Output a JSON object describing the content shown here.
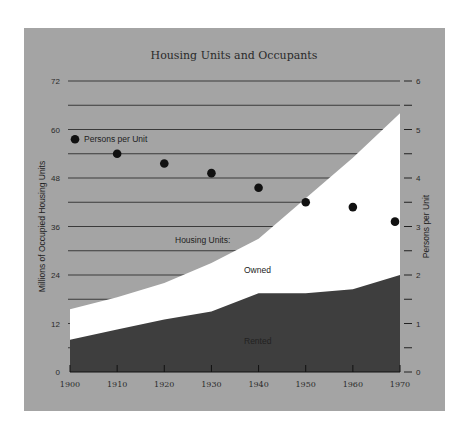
{
  "chart_data": {
    "type": "area",
    "title": "Housing Units and Occupants",
    "xlabel": "",
    "ylabel": "Millions of Occupied Housing Units",
    "ylabel_right": "Persons per Unit",
    "categories": [
      1900,
      1910,
      1920,
      1930,
      1940,
      1950,
      1960,
      1970
    ],
    "x_tick_labels": [
      "1900",
      "1910",
      "1920",
      "1930",
      "1940",
      "1950",
      "1960",
      "1970"
    ],
    "ylim": [
      0,
      72
    ],
    "y_ticks": [
      "0",
      "12",
      "24",
      "36",
      "48",
      "60",
      "72"
    ],
    "ylim_right": [
      0,
      6
    ],
    "y_ticks_right": [
      "0",
      "1",
      "2",
      "3",
      "4",
      "5",
      "6"
    ],
    "grid": "horizontal, every 6 units",
    "series": [
      {
        "name": "Rented",
        "kind": "area",
        "color": "#3e3e3e",
        "values": [
          8,
          10.5,
          13,
          15,
          19.5,
          19.5,
          20.5,
          24
        ]
      },
      {
        "name": "Owned",
        "kind": "area-stacked-top",
        "color": "#ffffff",
        "total_values": [
          15.5,
          18.5,
          22,
          27,
          33,
          43,
          53,
          64
        ]
      },
      {
        "name": "Persons per Unit",
        "kind": "scatter",
        "axis": "right",
        "color": "#111111",
        "values": [
          4.8,
          4.5,
          4.3,
          4.1,
          3.8,
          3.5,
          3.4,
          3.1
        ]
      }
    ],
    "annotations": [
      "Housing Units:",
      "Owned",
      "Rented",
      "Persons per Unit"
    ]
  },
  "labels": {
    "title": "Housing Units and Occupants",
    "left_axis": "Millions of Occupied Housing Units",
    "right_axis": "Persons per Unit",
    "legend_persons": "Persons per Unit",
    "housing_units": "Housing Units:",
    "owned": "Owned",
    "rented": "Rented"
  },
  "colors": {
    "background": "#a4a4a4",
    "rented": "#3e3e3e",
    "owned": "#ffffff",
    "grid": "#3a3a3a",
    "points": "#111111"
  }
}
